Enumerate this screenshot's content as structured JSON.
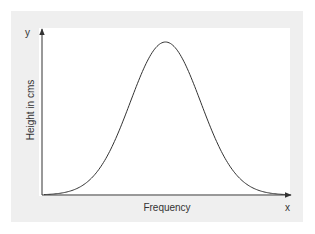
{
  "chart_data": {
    "type": "line",
    "title": "",
    "xlabel": "Frequency",
    "ylabel": "Height in cms",
    "x_axis_letter": "x",
    "y_axis_letter": "y",
    "grid": false,
    "legend": null,
    "x": [
      0,
      0.1,
      0.2,
      0.3,
      0.35,
      0.4,
      0.45,
      0.5,
      0.55,
      0.6,
      0.65,
      0.7,
      0.8,
      0.9,
      1.0
    ],
    "series": [
      {
        "name": "distribution",
        "values": [
          0.0,
          0.02,
          0.08,
          0.25,
          0.42,
          0.65,
          0.88,
          1.0,
          0.88,
          0.65,
          0.42,
          0.25,
          0.08,
          0.02,
          0.0
        ]
      }
    ],
    "xlim": [
      0,
      1
    ],
    "ylim": [
      0,
      1.1
    ]
  },
  "colors": {
    "panel": "#efefef",
    "plot_bg": "#ffffff",
    "axis": "#333333",
    "curve": "#333333"
  }
}
